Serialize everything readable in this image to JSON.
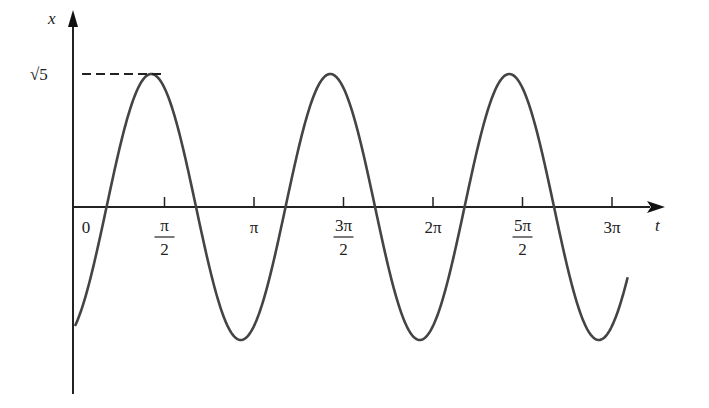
{
  "chart_data": {
    "type": "line",
    "title": "",
    "function": "x(t) = -2cos(2t) + sin(2t)",
    "xlabel": "t",
    "ylabel": "x",
    "amplitude_label": "√5",
    "x_tick_labels": [
      {
        "num": "0",
        "den": ""
      },
      {
        "num": "π",
        "den": "2"
      },
      {
        "num": "π",
        "den": ""
      },
      {
        "num": "3π",
        "den": "2"
      },
      {
        "num": "2π",
        "den": ""
      },
      {
        "num": "5π",
        "den": "2"
      },
      {
        "num": "3π",
        "den": ""
      }
    ],
    "x_tick_values": [
      0,
      1.5708,
      3.1416,
      4.7124,
      6.2832,
      7.854,
      9.4248
    ],
    "xlim": [
      0,
      9.75
    ],
    "ylim": [
      -2.8,
      2.8
    ],
    "series": [
      {
        "name": "x(t)",
        "x_start": 0,
        "x_end": 9.7,
        "value_at_0": -2,
        "max": 2.236,
        "min": -2.236,
        "period": 3.1416
      }
    ],
    "annotations": [
      {
        "type": "dashed-hline",
        "y": 2.236,
        "to_x": 1.339
      }
    ],
    "grid": false,
    "legend": null
  }
}
